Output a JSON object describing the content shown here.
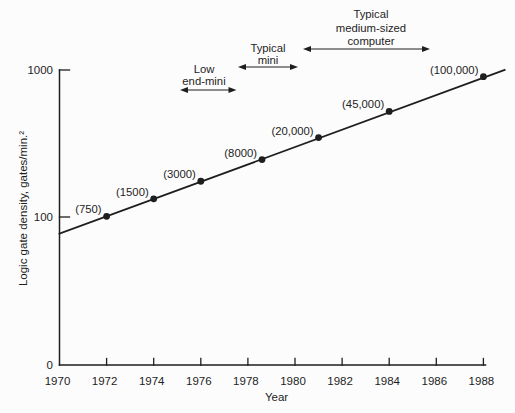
{
  "figure": {
    "background": "#fcfcfc",
    "ink_color": "#1e1e1e"
  },
  "chart_data": {
    "type": "line",
    "log_y": true,
    "title": "",
    "xlabel": "Year",
    "ylabel": "Logic gate density, gates/min.²",
    "xlim": [
      1970,
      1988
    ],
    "ylim_log": [
      100,
      1000
    ],
    "grid": false,
    "x_ticks": [
      1970,
      1972,
      1974,
      1976,
      1978,
      1980,
      1982,
      1984,
      1986,
      1988
    ],
    "y_ticks": [
      {
        "label": "1000",
        "value": 1000
      },
      {
        "label": "100",
        "value": 100
      },
      {
        "label": "0",
        "value": 0
      }
    ],
    "line": {
      "start": {
        "year": 1970,
        "value": 77
      },
      "end": {
        "year": 1988.9,
        "value": 1000
      }
    },
    "points": [
      {
        "year": 1972,
        "value": 101,
        "label": "(750)"
      },
      {
        "year": 1974,
        "value": 133,
        "label": "(1500)"
      },
      {
        "year": 1976,
        "value": 175,
        "label": "(3000)"
      },
      {
        "year": 1978.6,
        "value": 246,
        "label": "(8000)"
      },
      {
        "year": 1981,
        "value": 347,
        "label": "(20,000)"
      },
      {
        "year": 1984,
        "value": 523,
        "label": "(45,000)"
      },
      {
        "year": 1988,
        "value": 901,
        "label": "(100,000)"
      }
    ],
    "annotations": [
      {
        "id": "low-end-mini",
        "lines": [
          "Low",
          "end-mini"
        ],
        "cx": 204,
        "baselines": [
          72.5,
          85
        ],
        "arrow": {
          "x1": 180,
          "x2": 236.5,
          "y": 90
        }
      },
      {
        "id": "typical-mini",
        "lines": [
          "Typical",
          "mini"
        ],
        "cx": 268,
        "baselines": [
          52,
          63.5
        ],
        "arrow": {
          "x1": 238,
          "x2": 298,
          "y": 67
        }
      },
      {
        "id": "typical-medium-sized-computer",
        "lines": [
          "Typical",
          "medium-sized",
          "computer"
        ],
        "cx": 371,
        "baselines": [
          18,
          31.5,
          45
        ],
        "arrow": {
          "x1": 303,
          "x2": 430,
          "y": 49
        }
      }
    ]
  }
}
